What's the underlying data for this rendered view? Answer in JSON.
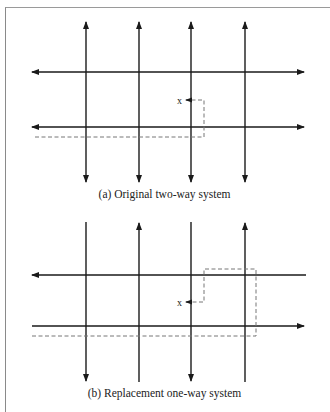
{
  "figure": {
    "panels": [
      {
        "id": "a",
        "caption": "(a) Original two-way system",
        "marker_label": "x",
        "vertical_streets": [
          {
            "x": 86,
            "direction": "two-way"
          },
          {
            "x": 139,
            "direction": "two-way"
          },
          {
            "x": 191,
            "direction": "two-way"
          },
          {
            "x": 245,
            "direction": "two-way"
          }
        ],
        "horizontal_streets": [
          {
            "y": 72,
            "direction": "two-way"
          },
          {
            "y": 127,
            "direction": "two-way"
          }
        ],
        "route": "dashed path from left edge along lower street, turning up to reach x"
      },
      {
        "id": "b",
        "caption": "(b) Replacement one-way system",
        "marker_label": "x",
        "vertical_streets": [
          {
            "x": 86,
            "direction": "down"
          },
          {
            "x": 139,
            "direction": "up"
          },
          {
            "x": 191,
            "direction": "down"
          },
          {
            "x": 245,
            "direction": "up"
          }
        ],
        "horizontal_streets": [
          {
            "y": 275,
            "direction": "left"
          },
          {
            "y": 326,
            "direction": "right"
          }
        ],
        "route": "dashed path from left edge along lower street, past x, up and around the block, back to x"
      }
    ],
    "colors": {
      "line": "#1a1a1a",
      "dashed": "#777777",
      "frame": "#8a8a8a"
    }
  }
}
